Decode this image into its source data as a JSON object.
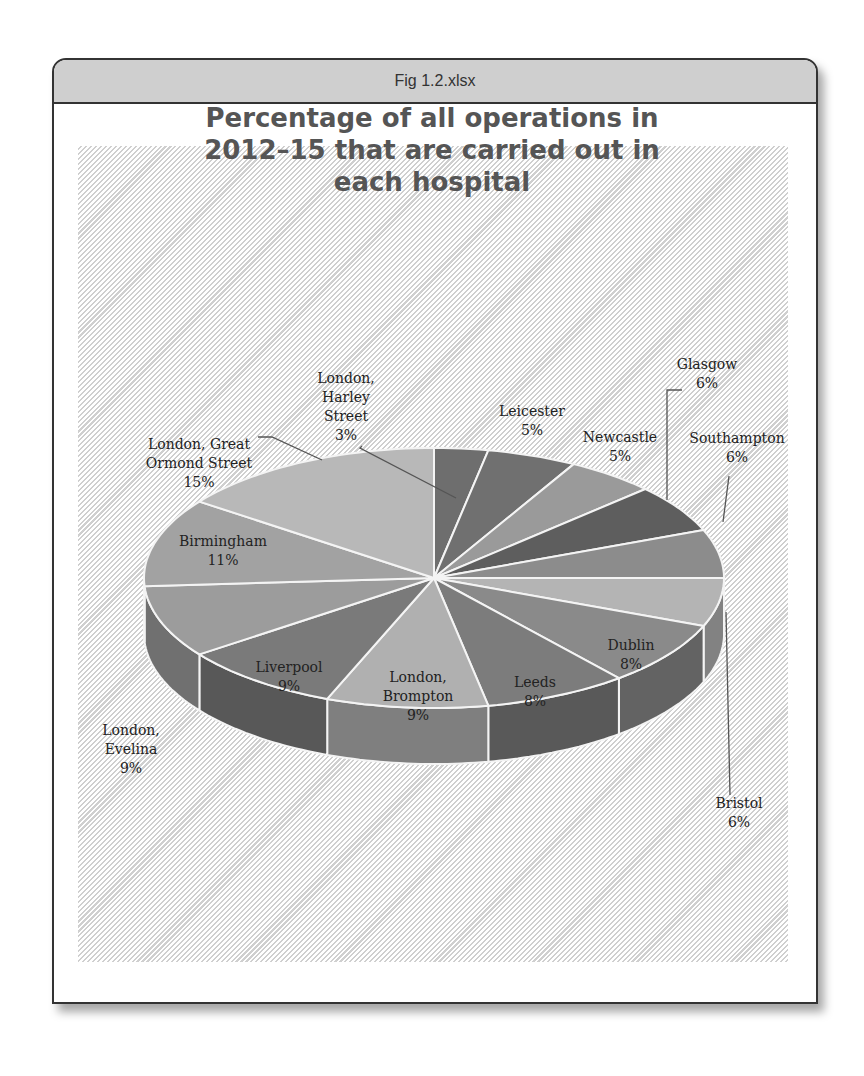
{
  "window": {
    "title": "Fig 1.2.xlsx"
  },
  "chart_data": {
    "type": "pie",
    "title": "Percentage of all operations in 2012–15 that are carried out in each hospital",
    "title_lines": [
      "Percentage of all operations in",
      "2012–15 that are carried out in",
      "each hospital"
    ],
    "three_d": true,
    "start_angle": "12 o'clock, clockwise",
    "categories": [
      "London, Harley Street",
      "Leicester",
      "Newcastle",
      "Glasgow",
      "Southampton",
      "Bristol",
      "Dublin",
      "Leeds",
      "London, Brompton",
      "Liverpool",
      "London, Evelina",
      "Birmingham",
      "London, Great Ormond Street"
    ],
    "values": [
      3,
      5,
      5,
      6,
      6,
      6,
      8,
      8,
      9,
      9,
      9,
      11,
      15
    ],
    "value_labels": [
      "3%",
      "5%",
      "5%",
      "6%",
      "6%",
      "6%",
      "8%",
      "8%",
      "9%",
      "9%",
      "9%",
      "11%",
      "15%"
    ],
    "colors": [
      "#6e6e6e",
      "#707070",
      "#9a9a9a",
      "#5e5e5e",
      "#8c8c8c",
      "#b4b4b4",
      "#8a8a8a",
      "#7c7c7c",
      "#b0b0b0",
      "#7a7a7a",
      "#9c9c9c",
      "#a2a2a2",
      "#b8b8b8"
    ],
    "labels": [
      {
        "lines": [
          "London,",
          "Harley",
          "Street",
          "3%"
        ],
        "x": 346,
        "y": 383,
        "leader": "M 362 446 L 360 448 L 456 498"
      },
      {
        "lines": [
          "Leicester",
          "5%"
        ],
        "x": 532,
        "y": 416
      },
      {
        "lines": [
          "Newcastle",
          "5%"
        ],
        "x": 620,
        "y": 442
      },
      {
        "lines": [
          "Glasgow",
          "6%"
        ],
        "x": 707,
        "y": 369,
        "leader": "M 682 390 L 667 390 L 667 500"
      },
      {
        "lines": [
          "Southampton",
          "6%"
        ],
        "x": 737,
        "y": 443,
        "leader": "M 729 476 L 723 522"
      },
      {
        "lines": [
          "Bristol",
          "6%"
        ],
        "x": 739,
        "y": 808,
        "leader": "M 730 795 L 726 612"
      },
      {
        "lines": [
          "Dublin",
          "8%"
        ],
        "x": 631,
        "y": 650
      },
      {
        "lines": [
          "Leeds",
          "8%"
        ],
        "x": 535,
        "y": 687
      },
      {
        "lines": [
          "London,",
          "Brompton",
          "9%"
        ],
        "x": 418,
        "y": 682
      },
      {
        "lines": [
          "Liverpool",
          "9%"
        ],
        "x": 289,
        "y": 672
      },
      {
        "lines": [
          "London,",
          "Evelina",
          "9%"
        ],
        "x": 131,
        "y": 735
      },
      {
        "lines": [
          "Birmingham",
          "11%"
        ],
        "x": 223,
        "y": 546
      },
      {
        "lines": [
          "London, Great",
          "Ormond Street",
          "15%"
        ],
        "x": 199,
        "y": 449,
        "leader": "M 258 437 L 272 437 L 322 460"
      }
    ]
  }
}
